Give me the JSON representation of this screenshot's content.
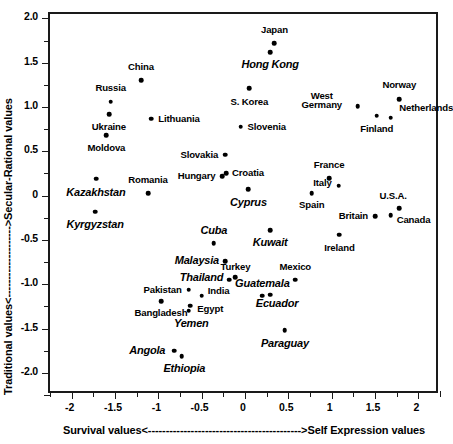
{
  "chart_data": {
    "type": "scatter",
    "title": "",
    "xlabel": "Survival values<------------------------------------------->Self Expression values",
    "ylabel": "Traditional values<-------------------->Secular-Rational values",
    "xlim": [
      -2.25,
      2.25
    ],
    "ylim": [
      -2.25,
      2.05
    ],
    "grid": false,
    "legend": false,
    "x_ticklabels": [
      "-2",
      "-1.5",
      "-1",
      "-0.5",
      "0",
      "0.5",
      "1",
      "1.5",
      "2"
    ],
    "x_tickvalues": [
      -2,
      -1.5,
      -1,
      -0.5,
      0,
      0.5,
      1,
      1.5,
      2
    ],
    "x_minor_step": 0.25,
    "y_ticklabels": [
      "2.0",
      "1.5",
      "1.0",
      "0.5",
      "0",
      "-0.5",
      "-1.0",
      "-1.5",
      "-2.0"
    ],
    "y_tickvalues": [
      2.0,
      1.5,
      1.0,
      0.5,
      0,
      -0.5,
      -1.0,
      -1.5,
      -2.0
    ],
    "y_minor_step": 0.25,
    "points": [
      {
        "label": "Japan",
        "x": 0.34,
        "y": 1.72,
        "style": "plain",
        "lx": 0.34,
        "ly": 1.87,
        "anchor": "center"
      },
      {
        "label": "Hong Kong",
        "x": 0.29,
        "y": 1.62,
        "style": "italic",
        "lx": 0.29,
        "ly": 1.47,
        "anchor": "center"
      },
      {
        "label": "China",
        "x": -1.2,
        "y": 1.3,
        "style": "plain",
        "lx": -1.2,
        "ly": 1.45,
        "anchor": "center"
      },
      {
        "label": "S. Korea",
        "x": 0.05,
        "y": 1.21,
        "style": "plain",
        "lx": 0.05,
        "ly": 1.06,
        "anchor": "center"
      },
      {
        "label": "Norway",
        "x": 1.78,
        "y": 1.09,
        "style": "plain",
        "lx": 1.78,
        "ly": 1.25,
        "anchor": "center"
      },
      {
        "label": "Russia",
        "x": -1.55,
        "y": 1.06,
        "style": "plain",
        "lx": -1.55,
        "ly": 1.21,
        "anchor": "center"
      },
      {
        "label": "West Germany",
        "x": 1.3,
        "y": 1.01,
        "style": "two-line",
        "lx": 1.12,
        "ly": 1.07,
        "anchor": "right"
      },
      {
        "label": "Ukraine",
        "x": -1.57,
        "y": 0.92,
        "style": "plain",
        "lx": -1.57,
        "ly": 0.78,
        "anchor": "center"
      },
      {
        "label": "Finland",
        "x": 1.52,
        "y": 0.9,
        "style": "plain",
        "lx": 1.52,
        "ly": 0.75,
        "anchor": "center"
      },
      {
        "label": "Netherlands",
        "x": 1.68,
        "y": 0.88,
        "style": "plain",
        "lx": 1.78,
        "ly": 0.99,
        "anchor": "left"
      },
      {
        "label": "Lithuania",
        "x": -1.08,
        "y": 0.87,
        "style": "plain",
        "lx": -1.0,
        "ly": 0.87,
        "anchor": "left"
      },
      {
        "label": "Slovenia",
        "x": -0.05,
        "y": 0.78,
        "style": "plain",
        "lx": 0.03,
        "ly": 0.78,
        "anchor": "left"
      },
      {
        "label": "Moldova",
        "x": -1.6,
        "y": 0.68,
        "style": "plain",
        "lx": -1.6,
        "ly": 0.54,
        "anchor": "center"
      },
      {
        "label": "Slovakia",
        "x": -0.23,
        "y": 0.46,
        "style": "plain",
        "lx": -0.31,
        "ly": 0.46,
        "anchor": "right"
      },
      {
        "label": "Croatia",
        "x": -0.22,
        "y": 0.25,
        "style": "plain",
        "lx": -0.15,
        "ly": 0.25,
        "anchor": "left"
      },
      {
        "label": "Hungary",
        "x": -0.26,
        "y": 0.22,
        "style": "plain",
        "lx": -0.34,
        "ly": 0.22,
        "anchor": "right"
      },
      {
        "label": "France",
        "x": 0.97,
        "y": 0.2,
        "style": "plain",
        "lx": 0.97,
        "ly": 0.35,
        "anchor": "center"
      },
      {
        "label": "Kazakhstan",
        "x": -1.72,
        "y": 0.19,
        "style": "italic",
        "lx": -1.72,
        "ly": 0.03,
        "anchor": "center"
      },
      {
        "label": "Italy",
        "x": 1.08,
        "y": 0.11,
        "style": "plain",
        "lx": 1.0,
        "ly": 0.14,
        "anchor": "right"
      },
      {
        "label": "Cyprus",
        "x": 0.04,
        "y": 0.07,
        "style": "italic",
        "lx": 0.04,
        "ly": -0.08,
        "anchor": "center"
      },
      {
        "label": "Romania",
        "x": -1.12,
        "y": 0.03,
        "style": "plain",
        "lx": -1.12,
        "ly": 0.18,
        "anchor": "center"
      },
      {
        "label": "Spain",
        "x": 0.77,
        "y": 0.03,
        "style": "plain",
        "lx": 0.77,
        "ly": -0.11,
        "anchor": "center"
      },
      {
        "label": "U.S.A.",
        "x": 1.78,
        "y": -0.14,
        "style": "plain",
        "lx": 1.71,
        "ly": 0.0,
        "anchor": "center"
      },
      {
        "label": "Kyrgyzstan",
        "x": -1.73,
        "y": -0.18,
        "style": "italic",
        "lx": -1.73,
        "ly": -0.33,
        "anchor": "center"
      },
      {
        "label": "Canada",
        "x": 1.68,
        "y": -0.22,
        "style": "plain",
        "lx": 1.75,
        "ly": -0.28,
        "anchor": "left"
      },
      {
        "label": "Britain",
        "x": 1.5,
        "y": -0.23,
        "style": "plain",
        "lx": 1.42,
        "ly": -0.23,
        "anchor": "right"
      },
      {
        "label": "Kuwait",
        "x": 0.29,
        "y": -0.39,
        "style": "italic",
        "lx": 0.29,
        "ly": -0.54,
        "anchor": "center"
      },
      {
        "label": "Ireland",
        "x": 1.09,
        "y": -0.44,
        "style": "plain",
        "lx": 1.09,
        "ly": -0.59,
        "anchor": "center"
      },
      {
        "label": "Cuba",
        "x": -0.36,
        "y": -0.54,
        "style": "italic",
        "lx": -0.36,
        "ly": -0.4,
        "anchor": "center"
      },
      {
        "label": "Malaysia",
        "x": -0.23,
        "y": -0.74,
        "style": "italic",
        "lx": -0.3,
        "ly": -0.74,
        "anchor": "right"
      },
      {
        "label": "Turkey",
        "x": -0.11,
        "y": -0.92,
        "style": "plain",
        "lx": -0.11,
        "ly": -0.8,
        "anchor": "center"
      },
      {
        "label": "Thailand",
        "x": -0.18,
        "y": -0.95,
        "style": "italic",
        "lx": -0.25,
        "ly": -0.93,
        "anchor": "right"
      },
      {
        "label": "Mexico",
        "x": 0.58,
        "y": -0.95,
        "style": "plain",
        "lx": 0.58,
        "ly": -0.81,
        "anchor": "center"
      },
      {
        "label": "Pakistan",
        "x": -0.65,
        "y": -1.06,
        "style": "plain",
        "lx": -0.73,
        "ly": -1.06,
        "anchor": "right"
      },
      {
        "label": "Guatemala",
        "x": 0.2,
        "y": -1.13,
        "style": "italic",
        "lx": 0.2,
        "ly": -1.0,
        "anchor": "center"
      },
      {
        "label": "Ecuador",
        "x": 0.29,
        "y": -1.12,
        "style": "italic",
        "lx": 0.37,
        "ly": -1.22,
        "anchor": "center"
      },
      {
        "label": "India",
        "x": -0.5,
        "y": -1.13,
        "style": "plain",
        "lx": -0.43,
        "ly": -1.08,
        "anchor": "left"
      },
      {
        "label": "Bangladesh",
        "x": -0.97,
        "y": -1.19,
        "style": "plain",
        "lx": -0.97,
        "ly": -1.32,
        "anchor": "center"
      },
      {
        "label": "Egypt",
        "x": -0.63,
        "y": -1.24,
        "style": "plain",
        "lx": -0.55,
        "ly": -1.28,
        "anchor": "left"
      },
      {
        "label": "Yemen",
        "x": -0.65,
        "y": -1.3,
        "style": "italic",
        "lx": -0.62,
        "ly": -1.45,
        "anchor": "center"
      },
      {
        "label": "Paraguay",
        "x": 0.46,
        "y": -1.52,
        "style": "italic",
        "lx": 0.46,
        "ly": -1.67,
        "anchor": "center"
      },
      {
        "label": "Angola",
        "x": -0.82,
        "y": -1.75,
        "style": "italic",
        "lx": -0.92,
        "ly": -1.75,
        "anchor": "right"
      },
      {
        "label": "Ethiopia",
        "x": -0.73,
        "y": -1.81,
        "style": "italic",
        "lx": -0.7,
        "ly": -1.96,
        "anchor": "center"
      }
    ]
  }
}
